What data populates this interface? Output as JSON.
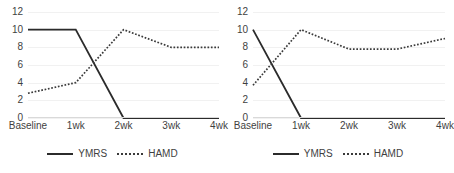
{
  "figure": {
    "background": "#ffffff",
    "series_colors": {
      "ymrs": "#2b2b2b",
      "hamd": "#3a3a3a"
    }
  },
  "chart_data": [
    {
      "type": "line",
      "panel": "left",
      "title": "",
      "xlabel": "",
      "ylabel": "",
      "categories": [
        "Baseline",
        "1wk",
        "2wk",
        "3wk",
        "4wk"
      ],
      "yticks": [
        0,
        2,
        4,
        6,
        8,
        10,
        12
      ],
      "ylim": [
        0,
        12
      ],
      "grid": true,
      "legend_position": "bottom-center",
      "series": [
        {
          "name": "YMRS",
          "style": "solid",
          "values": [
            10,
            10,
            0,
            0,
            0
          ]
        },
        {
          "name": "HAMD",
          "style": "dotted",
          "values": [
            2.8,
            4,
            10,
            8,
            8
          ]
        }
      ]
    },
    {
      "type": "line",
      "panel": "right",
      "title": "",
      "xlabel": "",
      "ylabel": "",
      "categories": [
        "Baseline",
        "1wk",
        "2wk",
        "3wk",
        "4wk"
      ],
      "yticks": [
        0,
        2,
        4,
        6,
        8,
        10,
        12
      ],
      "ylim": [
        0,
        12
      ],
      "grid": true,
      "legend_position": "bottom-center",
      "series": [
        {
          "name": "YMRS",
          "style": "solid",
          "values": [
            10,
            0,
            0,
            0,
            0
          ]
        },
        {
          "name": "HAMD",
          "style": "dotted",
          "values": [
            3.7,
            10,
            7.8,
            7.8,
            9
          ]
        }
      ]
    }
  ],
  "panels": [
    {
      "ylabels": [
        "12",
        "10",
        "8",
        "6",
        "4",
        "2",
        "0"
      ],
      "xlabels": [
        "Baseline",
        "1wk",
        "2wk",
        "3wk",
        "4wk"
      ],
      "legend": [
        {
          "label": "YMRS",
          "style": "solid"
        },
        {
          "label": "HAMD",
          "style": "dotted"
        }
      ]
    },
    {
      "ylabels": [
        "12",
        "10",
        "8",
        "6",
        "4",
        "2",
        "0"
      ],
      "xlabels": [
        "Baseline",
        "1wk",
        "2wk",
        "3wk",
        "4wk"
      ],
      "legend": [
        {
          "label": "YMRS",
          "style": "solid"
        },
        {
          "label": "HAMD",
          "style": "dotted"
        }
      ]
    }
  ]
}
